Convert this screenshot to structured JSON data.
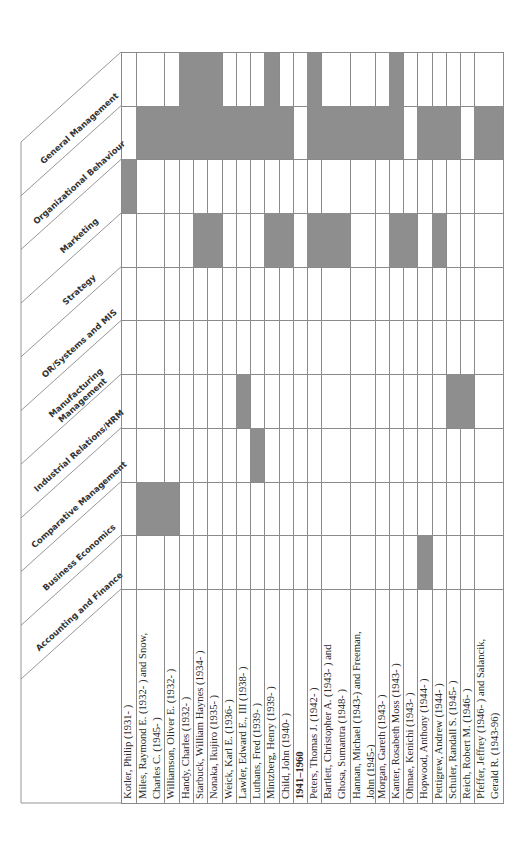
{
  "table": {
    "categories": [
      {
        "label": "General Management",
        "lines": [
          "General Management"
        ]
      },
      {
        "label": "Organizational Behaviour",
        "lines": [
          "Organizational Behaviour"
        ]
      },
      {
        "label": "Marketing",
        "lines": [
          "Marketing"
        ]
      },
      {
        "label": "Strategy",
        "lines": [
          "Strategy"
        ]
      },
      {
        "label": "OR/Systems and MIS",
        "lines": [
          "OR/Systems and MIS"
        ]
      },
      {
        "label": "Manufacturing Management",
        "lines": [
          "Manufacturing",
          "Management"
        ]
      },
      {
        "label": "Industrial Relations/HRM",
        "lines": [
          "Industrial Relations/HRM"
        ]
      },
      {
        "label": "Comparative Management",
        "lines": [
          "Comparative Management"
        ]
      },
      {
        "label": "Business Economics",
        "lines": [
          "Business Economics"
        ]
      },
      {
        "label": "Accounting and Finance",
        "lines": [
          "Accounting and Finance"
        ]
      }
    ],
    "rows": [
      {
        "name": "Kotler, Philip (1931- )",
        "x0": 121,
        "x1": 136,
        "marks": [
          "Marketing"
        ]
      },
      {
        "name": "Miles, Raymond E. (1932- ) and Snow, Charles C. (1945- )",
        "x0": 136,
        "x1": 164,
        "marks": [
          "Organizational Behaviour",
          "Business Economics"
        ]
      },
      {
        "name": "Williamson, Oliver E. (1932- )",
        "x0": 164,
        "x1": 179,
        "marks": [
          "Organizational Behaviour",
          "Business Economics"
        ]
      },
      {
        "name": "Handy, Charles (1932- )",
        "x0": 179,
        "x1": 193,
        "marks": [
          "General Management",
          "Organizational Behaviour"
        ]
      },
      {
        "name": "Starbuck, William Haynes (1934- )",
        "x0": 193,
        "x1": 207,
        "marks": [
          "General Management",
          "Organizational Behaviour",
          "Strategy"
        ]
      },
      {
        "name": "Nonaka, Ikujiro (1935- )",
        "x0": 207,
        "x1": 222,
        "marks": [
          "General Management",
          "Organizational Behaviour",
          "Strategy"
        ]
      },
      {
        "name": "Weick, Karl E. (1936- )",
        "x0": 222,
        "x1": 236,
        "marks": [
          "Organizational Behaviour"
        ]
      },
      {
        "name": "Lawler, Edward E., III (1938- )",
        "x0": 236,
        "x1": 250,
        "marks": [
          "Organizational Behaviour",
          "Industrial Relations/HRM"
        ]
      },
      {
        "name": "Luthans, Fred (1939- )",
        "x0": 250,
        "x1": 264,
        "marks": [
          "Organizational Behaviour",
          "Comparative Management"
        ]
      },
      {
        "name": "Mintzberg, Henry (1939- )",
        "x0": 264,
        "x1": 279,
        "marks": [
          "General Management",
          "Organizational Behaviour",
          "Strategy"
        ]
      },
      {
        "name": "Child, John (1940- )",
        "x0": 279,
        "x1": 293,
        "marks": [
          "Organizational Behaviour",
          "Strategy"
        ]
      },
      {
        "name": "1941–1960",
        "x0": 293,
        "x1": 307,
        "section": true,
        "marks": []
      },
      {
        "name": "Peters, Thomas J. (1942- )",
        "x0": 307,
        "x1": 321,
        "marks": [
          "General Management",
          "Organizational Behaviour",
          "Strategy"
        ]
      },
      {
        "name": "Bartlett, Christopher A. (1943- ) and Ghosa, Sumantra (1948- )",
        "x0": 321,
        "x1": 350,
        "marks": [
          "Organizational Behaviour",
          "Strategy"
        ]
      },
      {
        "name": "Hannan, Michael (1943-) and Freeman, John (1945-)",
        "x0": 350,
        "x1": 375,
        "marks": [
          "Organizational Behaviour"
        ]
      },
      {
        "name": "Morgan, Gareth (1943- )",
        "x0": 375,
        "x1": 389,
        "marks": [
          "Organizational Behaviour"
        ]
      },
      {
        "name": "Kanter, Rosabeth Moss (1943- )",
        "x0": 389,
        "x1": 403,
        "marks": [
          "General Management",
          "Organizational Behaviour",
          "Strategy"
        ]
      },
      {
        "name": "Ohmae, Kenichi (1943- )",
        "x0": 403,
        "x1": 417,
        "marks": [
          "Strategy"
        ]
      },
      {
        "name": "Hopwood, Anthony (1944- )",
        "x0": 417,
        "x1": 432,
        "marks": [
          "Organizational Behaviour",
          "Accounting and Finance"
        ]
      },
      {
        "name": "Pettigrew, Andrew (1944- )",
        "x0": 432,
        "x1": 446,
        "marks": [
          "Organizational Behaviour",
          "Strategy"
        ]
      },
      {
        "name": "Schuler, Randall S. (1945- )",
        "x0": 446,
        "x1": 460,
        "marks": [
          "Organizational Behaviour",
          "Industrial Relations/HRM"
        ]
      },
      {
        "name": "Reich, Robert M. (1946- )",
        "x0": 460,
        "x1": 474,
        "marks": [
          "Industrial Relations/HRM"
        ]
      },
      {
        "name": "Pfeffer, Jeffrey (1946- ) and Salancik, Gerald R. (1943-96)",
        "x0": 474,
        "x1": 503,
        "marks": [
          "Organizational Behaviour"
        ]
      }
    ]
  },
  "colors": {
    "shade": "#8e8e8e",
    "grid": "#8a8a8a"
  }
}
